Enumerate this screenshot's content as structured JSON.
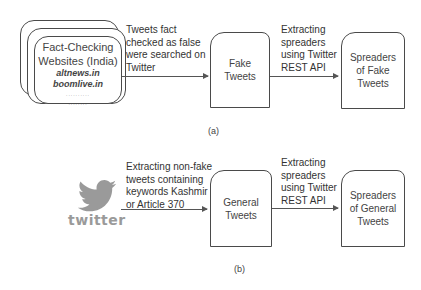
{
  "diagram_a": {
    "source": {
      "title_line1": "Fact-Checking",
      "title_line2": "Websites (India)",
      "sites": [
        "altnews.in",
        "boomlive.in"
      ],
      "ellipsis_1": "..........",
      "ellipsis_2": "........"
    },
    "edge1_label": [
      "Tweets fact",
      "checked as false",
      "were searched on",
      "Twitter"
    ],
    "node1": [
      "Fake",
      "Tweets"
    ],
    "edge2_label": [
      "Extracting",
      "spreaders",
      "using Twitter",
      "REST API"
    ],
    "node2": [
      "Spreaders",
      "of Fake",
      "Tweets"
    ],
    "caption": "(a)"
  },
  "diagram_b": {
    "source": {
      "logo_icon": "twitter-bird-icon",
      "logo_text": "twitter"
    },
    "edge1_label": [
      "Extracting non-fake",
      "tweets containing",
      "keywords Kashmir",
      "or Article 370"
    ],
    "node1": [
      "General",
      "Tweets"
    ],
    "edge2_label": [
      "Extracting",
      "spreaders",
      "using Twitter",
      "REST API"
    ],
    "node2": [
      "Spreaders",
      "of General",
      "Tweets"
    ],
    "caption": "(b)"
  },
  "colors": {
    "stroke": "#4a4a4a",
    "text": "#333333",
    "twitter_logo": "#9a9a9a"
  }
}
